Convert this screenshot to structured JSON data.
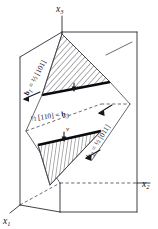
{
  "figure": {
    "background_color": "#ffffff",
    "line_color": "#2b2b33",
    "band_color": "#0b0b0f",
    "axes": [
      {
        "id": "x3",
        "base": "x",
        "subscript": "3",
        "position": "top"
      },
      {
        "id": "x2",
        "base": "x",
        "subscript": "2",
        "position": "right"
      },
      {
        "id": "x1",
        "base": "x",
        "subscript": "1",
        "position": "bottom-left"
      }
    ],
    "burgers_vectors": [
      {
        "id": "b1",
        "symbol": "b",
        "subscript": "1",
        "relation": "=",
        "fraction": "½",
        "direction": "[101]",
        "full_label": "b₁ = ½ [101]",
        "position": "upper-left",
        "rotation_deg": -62
      },
      {
        "id": "b3",
        "symbol": "b",
        "subscript": "3",
        "relation": "=",
        "fraction": "½",
        "direction": "[110]",
        "full_label": "½ [110] = b₃",
        "position": "middle",
        "rotation_deg": -8
      },
      {
        "id": "b2",
        "symbol": "b",
        "subscript": "2",
        "relation": "=",
        "fraction": "½",
        "direction": "[011]",
        "full_label": "b₂ = ½ [011]",
        "position": "lower-right",
        "rotation_deg": -58
      }
    ],
    "velocity_labels": [
      {
        "id": "v-upper",
        "symbol": "v",
        "position": "upper-band"
      },
      {
        "id": "v-lower",
        "symbol": "v",
        "position": "lower-band"
      }
    ],
    "slip_planes": [
      {
        "id": "upper-slip-plane",
        "hatch": "diagonal",
        "edge": "thick-black"
      },
      {
        "id": "lower-slip-plane",
        "hatch": "vertical",
        "edge": "thick-black"
      }
    ]
  }
}
